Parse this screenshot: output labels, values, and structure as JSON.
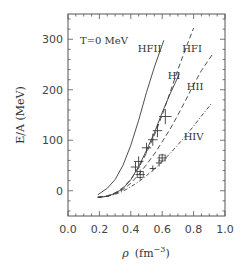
{
  "chart_data": {
    "type": "line",
    "title": "",
    "annotation": "T=0 MeV",
    "xlabel": "ρ (fm⁻³)",
    "xlabel_parts": {
      "symbol": "ρ",
      "unit_open": "(fm",
      "exponent": "−3",
      "unit_close": ")"
    },
    "ylabel": "E/A (MeV)",
    "xlim": [
      0.0,
      1.0
    ],
    "ylim": [
      -50,
      350
    ],
    "xticks": [
      0.0,
      0.2,
      0.4,
      0.6,
      0.8,
      1.0
    ],
    "xtick_labels": [
      "0.0",
      "0.2",
      "0.4",
      "0.6",
      "0.8",
      "1.0"
    ],
    "yticks": [
      0,
      100,
      200,
      300
    ],
    "ytick_labels": [
      "0",
      "100",
      "200",
      "300"
    ],
    "grid": false,
    "legend": "inline labels",
    "series": [
      {
        "name": "HFII",
        "style": "solid",
        "x": [
          0.19,
          0.25,
          0.3,
          0.35,
          0.4,
          0.45,
          0.5,
          0.55,
          0.61
        ],
        "y": [
          -8,
          5,
          22,
          50,
          90,
          140,
          195,
          245,
          298
        ],
        "label_pos": [
          0.52,
          275
        ]
      },
      {
        "name": "HFI",
        "style": "dashed",
        "x": [
          0.19,
          0.25,
          0.3,
          0.35,
          0.4,
          0.45,
          0.5,
          0.55,
          0.6,
          0.65,
          0.7,
          0.75,
          0.8
        ],
        "y": [
          -13,
          -10,
          -4,
          6,
          22,
          45,
          75,
          110,
          150,
          195,
          240,
          282,
          322
        ],
        "label_pos": [
          0.79,
          275
        ]
      },
      {
        "name": "HI",
        "style": "solid",
        "x": [
          0.19,
          0.25,
          0.3,
          0.35,
          0.4,
          0.45,
          0.5,
          0.55,
          0.6,
          0.65,
          0.71
        ],
        "y": [
          -13,
          -11,
          -5,
          4,
          22,
          48,
          80,
          115,
          155,
          192,
          232
        ],
        "label_pos": [
          0.675,
          222
        ]
      },
      {
        "name": "HII",
        "style": "dashed",
        "x": [
          0.19,
          0.25,
          0.3,
          0.35,
          0.4,
          0.45,
          0.5,
          0.55,
          0.6,
          0.65,
          0.7,
          0.75,
          0.8,
          0.85,
          0.92
        ],
        "y": [
          -13,
          -11,
          -6,
          2,
          15,
          32,
          52,
          73,
          97,
          122,
          150,
          180,
          210,
          238,
          270
        ],
        "label_pos": [
          0.81,
          200
        ]
      },
      {
        "name": "HIV",
        "style": "dash-dot",
        "x": [
          0.19,
          0.25,
          0.3,
          0.35,
          0.4,
          0.45,
          0.5,
          0.55,
          0.6,
          0.65,
          0.7,
          0.75,
          0.8,
          0.85,
          0.92
        ],
        "y": [
          -13,
          -11,
          -7,
          -1,
          8,
          18,
          30,
          43,
          58,
          74,
          91,
          109,
          128,
          148,
          175
        ],
        "label_pos": [
          0.8,
          100
        ]
      }
    ],
    "points": {
      "name": "data (crosses with error bars)",
      "x": [
        0.62,
        0.57,
        0.54,
        0.5,
        0.45,
        0.43,
        0.46,
        0.6,
        0.58,
        0.54
      ],
      "y": [
        147,
        119,
        101,
        85,
        58,
        47,
        32,
        65,
        55,
        44
      ],
      "xerr": [
        0.04,
        0.03,
        0.03,
        0.03,
        0.03,
        0.03,
        0.03,
        0.03,
        0.02,
        0.02
      ],
      "yerr": [
        15,
        13,
        12,
        10,
        10,
        10,
        10,
        8,
        7,
        6
      ]
    },
    "boxes": {
      "x": [
        0.46,
        0.6
      ],
      "y": [
        32,
        65
      ]
    }
  }
}
